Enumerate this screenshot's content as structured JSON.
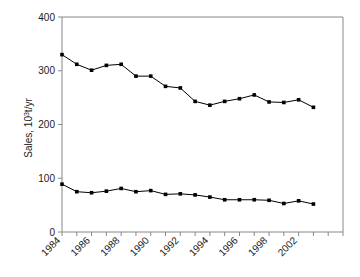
{
  "chart_data": {
    "type": "line",
    "title": "",
    "subtitle": "",
    "xlabel": "",
    "ylabel": "Sales, 10³t/yr",
    "ylabel_parts": {
      "base": "Sales, 10",
      "exponent": "3",
      "suffix": "t/yr"
    },
    "xlim": [
      1984,
      2003
    ],
    "ylim": [
      0,
      400
    ],
    "yticks": [
      0,
      100,
      200,
      300,
      400
    ],
    "ytick_labels": [
      "0",
      "100",
      "200",
      "300",
      "400"
    ],
    "xticks": [
      1984,
      1985,
      1986,
      1987,
      1988,
      1989,
      1990,
      1991,
      1992,
      1993,
      1994,
      1995,
      1996,
      1997,
      1998,
      1999,
      2000,
      2001,
      2002,
      2003
    ],
    "xtick_labels_shown": [
      "1984",
      "1986",
      "1988",
      "1990",
      "1992",
      "1994",
      "1996",
      "1998",
      "2002"
    ],
    "xtick_labels_shown_years": [
      1984,
      1986,
      1988,
      1990,
      1992,
      1994,
      1996,
      1998,
      2000
    ],
    "xtick_label_rotation": 45,
    "grid": false,
    "legend": "none",
    "marker": "square",
    "marker_color": "#000000",
    "line_color": "#000000",
    "x": [
      1984,
      1985,
      1986,
      1987,
      1988,
      1989,
      1990,
      1991,
      1992,
      1993,
      1994,
      1995,
      1996,
      1997,
      1998,
      1999,
      2000,
      2001,
      2002,
      2003
    ],
    "series": [
      {
        "name": "upper-series",
        "values": [
          330,
          312,
          301,
          310,
          312,
          290,
          290,
          271,
          268,
          243,
          236,
          243,
          248,
          255,
          242,
          241,
          246,
          232,
          null,
          null
        ]
      },
      {
        "name": "lower-series",
        "values": [
          89,
          75,
          73,
          76,
          81,
          75,
          77,
          70,
          71,
          69,
          65,
          60,
          60,
          60,
          59,
          53,
          58,
          52,
          null,
          null
        ]
      }
    ],
    "series_point_count": 18
  },
  "axes": {
    "y_axis_name": "y-axis",
    "x_axis_name": "x-axis",
    "spine_color": "#808080"
  }
}
